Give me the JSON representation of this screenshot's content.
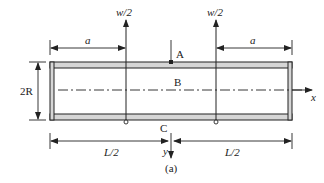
{
  "figure": {
    "caption": "(a)",
    "colors": {
      "stroke": "#222222",
      "flange_fill": "#d6d6d6",
      "background": "#ffffff"
    }
  },
  "loads": {
    "left": {
      "label": "w/2"
    },
    "right": {
      "label": "w/2"
    }
  },
  "dimensions": {
    "left_a": "a",
    "right_a": "a",
    "height": "2R",
    "left_half": "L/2",
    "right_half": "L/2"
  },
  "points": {
    "A": "A",
    "B": "B",
    "C": "C"
  },
  "axes": {
    "x": "x",
    "y": "y"
  }
}
